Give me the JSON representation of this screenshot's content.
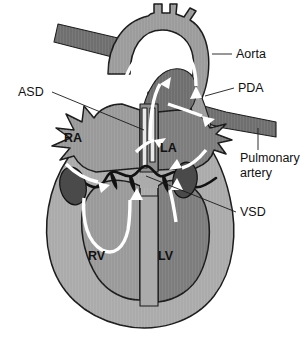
{
  "figure": {
    "background_color": "#ffffff",
    "callout_labels": [
      {
        "id": "aorta",
        "text": "Aorta"
      },
      {
        "id": "pda",
        "text": "PDA"
      },
      {
        "id": "pulmonary-artery-line1",
        "text": "Pulmonary"
      },
      {
        "id": "pulmonary-artery-line2",
        "text": "artery"
      },
      {
        "id": "vsd",
        "text": "VSD"
      },
      {
        "id": "asd",
        "text": "ASD"
      }
    ],
    "chamber_labels": [
      {
        "id": "ra",
        "text": "RA"
      },
      {
        "id": "la",
        "text": "LA"
      },
      {
        "id": "rv",
        "text": "RV"
      },
      {
        "id": "lv",
        "text": "LV"
      }
    ],
    "colors": {
      "myocardium": "#ababab",
      "right_chamber": "#9a9a9a",
      "left_chamber": "#7d7d7d",
      "great_vessel_light": "#9c9c9c",
      "great_vessel_dark": "#6f6f6f",
      "valve_ellipse": "#4a4a4a",
      "outline": "#1b1b1b",
      "flow_arrow": "#ffffff",
      "label_text": "#111111"
    }
  }
}
